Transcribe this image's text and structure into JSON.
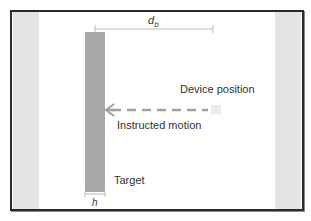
{
  "diagram": {
    "labels": {
      "distance": "d",
      "distance_sub": "b",
      "device_position": "Device position",
      "instructed_motion": "Instructed motion",
      "target": "Target",
      "width": "h"
    },
    "colors": {
      "frame": "#2a2a2a",
      "side_band": "#e4e4e4",
      "target_bar": "#a9a9a9",
      "arrow": "#a0a0a0",
      "dimension_line": "#bbbbbb"
    }
  }
}
